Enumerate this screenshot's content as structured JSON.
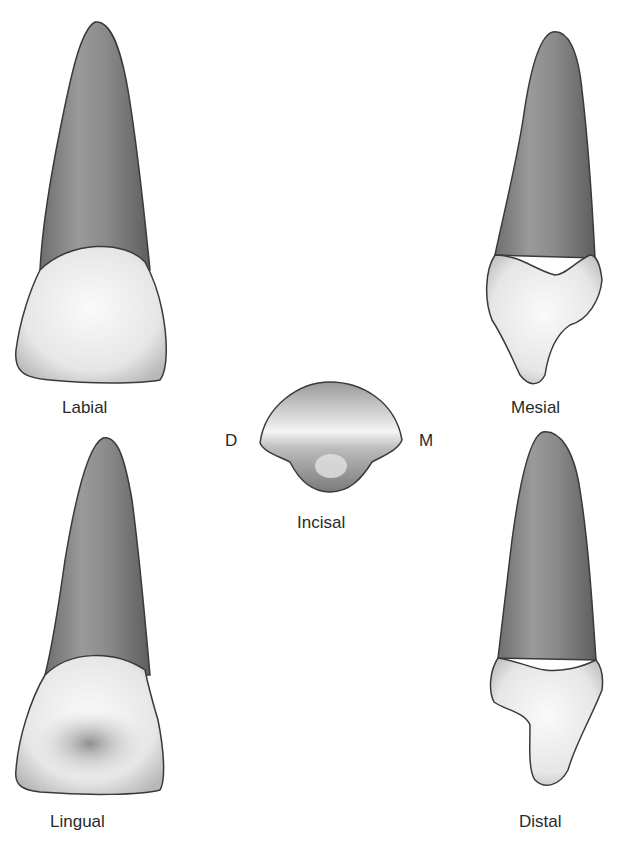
{
  "figure": {
    "views": [
      {
        "id": "labial",
        "label": "Labial"
      },
      {
        "id": "mesial",
        "label": "Mesial"
      },
      {
        "id": "incisal",
        "label": "Incisal"
      },
      {
        "id": "lingual",
        "label": "Lingual"
      },
      {
        "id": "distal",
        "label": "Distal"
      }
    ],
    "incisal_markers": {
      "left": "D",
      "right": "M"
    },
    "colors": {
      "root": "#8c8c8c",
      "crown": "#ececec",
      "outline": "#3a3a3a",
      "background": "#ffffff"
    }
  }
}
